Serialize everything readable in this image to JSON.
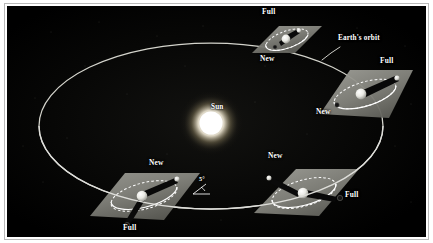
{
  "figure": {
    "background_color": "#000000",
    "frame_color": "#b9b9b9",
    "label_color": "#ffffff"
  },
  "colors": {
    "sun_core": "#ffffff",
    "sun_glow": "#fff6d8",
    "earth_orbit_line": "#d8d8d0",
    "moon_orbit_line": "#ffffff",
    "plane_fill": "#8d8d86",
    "plane_fill_dark": "#5e5e58",
    "shadow_cone": "#0a0a0a",
    "earth_body": "#f2f2ee",
    "moon_body": "#dededa"
  },
  "sun": {
    "label": "Sun",
    "cx": 204,
    "cy": 117,
    "radius": 13
  },
  "earth_orbit": {
    "label": "Earth's orbit",
    "leader_from": {
      "x": 333,
      "y": 41
    },
    "leader_to": {
      "x": 318,
      "y": 53
    },
    "cx": 204,
    "cy": 120,
    "rx": 172,
    "ry": 83
  },
  "inclination": {
    "label": "5°",
    "value_degrees": 5,
    "x": 196,
    "y": 182
  },
  "panels": [
    {
      "id": "panel-top",
      "name": "moon-orbit-plane-top",
      "cx": 279,
      "cy": 36,
      "labels": [
        {
          "text": "Full",
          "x": 262,
          "y": 10,
          "name": "full-moon-label"
        },
        {
          "text": "New",
          "x": 260,
          "y": 57,
          "name": "new-moon-label"
        }
      ]
    },
    {
      "id": "panel-right",
      "name": "moon-orbit-plane-right",
      "cx": 360,
      "cy": 92,
      "labels": [
        {
          "text": "Full",
          "x": 377,
          "y": 58,
          "name": "full-moon-label"
        },
        {
          "text": "New",
          "x": 318,
          "y": 110,
          "name": "new-moon-label"
        }
      ]
    },
    {
      "id": "panel-bottom-right",
      "name": "moon-orbit-plane-bottom-right",
      "cx": 297,
      "cy": 193,
      "labels": [
        {
          "text": "New",
          "x": 268,
          "y": 153,
          "name": "new-moon-label"
        },
        {
          "text": "Full",
          "x": 345,
          "y": 194,
          "name": "full-moon-label"
        }
      ]
    },
    {
      "id": "panel-bottom-left",
      "name": "moon-orbit-plane-bottom-left",
      "cx": 137,
      "cy": 195,
      "labels": [
        {
          "text": "New",
          "x": 148,
          "y": 161,
          "name": "new-moon-label"
        },
        {
          "text": "Full",
          "x": 122,
          "y": 226,
          "name": "full-moon-label"
        }
      ]
    }
  ]
}
